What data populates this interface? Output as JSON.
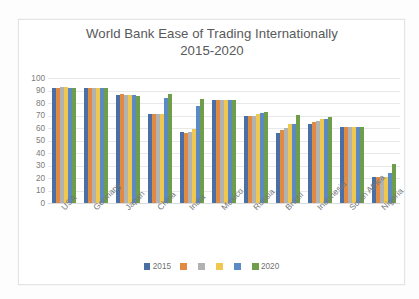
{
  "chart_data": {
    "type": "bar",
    "title": "World Bank Ease of Trading Internationally",
    "subtitle": "2015-2020",
    "xlabel": "",
    "ylabel": "",
    "ylim": [
      0,
      100
    ],
    "ytick_step": 10,
    "yticks": [
      "100",
      "90",
      "80",
      "70",
      "60",
      "50",
      "40",
      "30",
      "20",
      "10",
      "0"
    ],
    "grid": true,
    "legend_position": "bottom",
    "categories": [
      "USA",
      "Germany",
      "Japan",
      "China",
      "India",
      "Mexico",
      "Russia",
      "Brazil",
      "Indonesia",
      "South Africa",
      "Nigeria"
    ],
    "series": [
      {
        "name": "2015",
        "color": "#4a6fa5",
        "values": [
          92,
          92,
          86.5,
          71,
          57,
          82.5,
          70,
          56,
          63.5,
          60.5,
          20.5
        ]
      },
      {
        "name": "",
        "color": "#e08a42",
        "values": [
          92,
          92,
          87,
          71,
          56,
          82.5,
          70,
          58.5,
          64.5,
          61,
          20.5
        ]
      },
      {
        "name": "",
        "color": "#b2b2b2",
        "values": [
          92.5,
          92,
          86.5,
          71,
          57,
          82.5,
          70,
          60,
          66,
          61,
          20.5
        ]
      },
      {
        "name": "",
        "color": "#f0c850",
        "values": [
          92.5,
          92,
          86.5,
          71,
          59,
          82.5,
          71,
          63.5,
          67.5,
          61,
          20.5
        ]
      },
      {
        "name": "",
        "color": "#5b8ac4",
        "values": [
          92,
          92,
          86.5,
          84,
          78,
          82.5,
          72,
          63.5,
          67.5,
          60.5,
          24
        ]
      },
      {
        "name": "2020",
        "color": "#6e9e4a",
        "values": [
          92,
          92,
          86,
          87,
          83,
          82.5,
          72.5,
          70.5,
          68.5,
          60.5,
          31
        ]
      }
    ],
    "legend_entries": [
      {
        "label": "2015",
        "color": "#4a6fa5"
      },
      {
        "label": "",
        "color": "#e08a42"
      },
      {
        "label": "",
        "color": "#b2b2b2"
      },
      {
        "label": "",
        "color": "#f0c850"
      },
      {
        "label": "",
        "color": "#5b8ac4"
      },
      {
        "label": "2020",
        "color": "#6e9e4a"
      }
    ]
  }
}
